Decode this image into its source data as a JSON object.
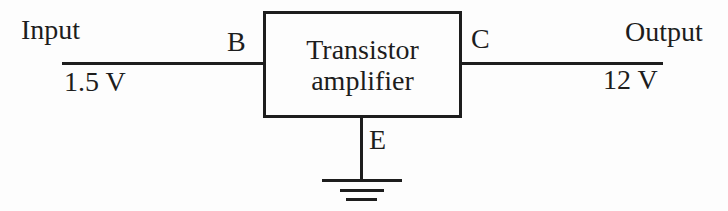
{
  "diagram": {
    "type": "block-diagram",
    "block": {
      "line1": "Transistor",
      "line2": "amplifier"
    },
    "input": {
      "label": "Input",
      "voltage": "1.5 V"
    },
    "output": {
      "label": "Output",
      "voltage": "12 V"
    },
    "terminals": {
      "base": "B",
      "collector": "C",
      "emitter": "E"
    },
    "icons": {
      "ground": "earth-ground-icon"
    },
    "colors": {
      "line": "#1d1d1d",
      "text": "#1d1d1d",
      "background": "#fdfdfd"
    }
  }
}
